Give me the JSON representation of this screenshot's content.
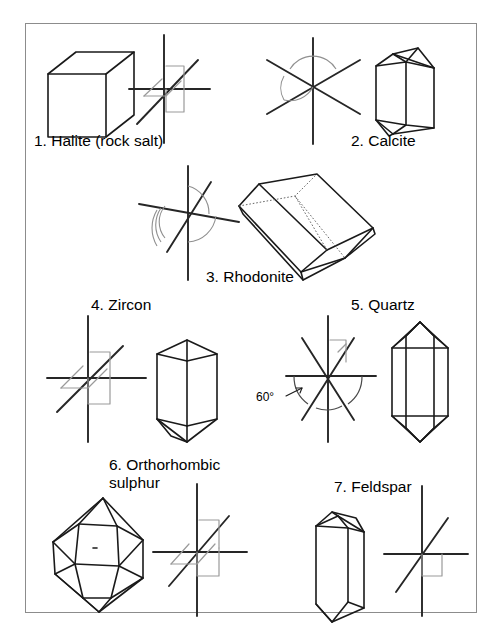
{
  "figure": {
    "title_visible": false,
    "border_color": "#8c8c8c",
    "background": "#ffffff",
    "ink_color": "#1a1a1a",
    "faint_color": "#9a9a9a"
  },
  "items": [
    {
      "id": 1,
      "number": "1.",
      "name": "Halite (rock salt)",
      "caption": "1. Halite (rock salt)",
      "crystal_shape": "cube",
      "axis_system": "cubic",
      "axes_count": 3,
      "angle_label": null
    },
    {
      "id": 2,
      "number": "2.",
      "name": "Calcite",
      "caption": "2. Calcite",
      "crystal_shape": "hexagonal-prism",
      "axis_system": "hexagonal-rhombohedral",
      "axes_count": 4,
      "angle_label": null
    },
    {
      "id": 3,
      "number": "3.",
      "name": "Rhodonite",
      "caption": "3. Rhodonite",
      "crystal_shape": "oblique-box",
      "axis_system": "triclinic",
      "axes_count": 3,
      "angle_label": null
    },
    {
      "id": 4,
      "number": "4.",
      "name": "Zircon",
      "caption": "4. Zircon",
      "crystal_shape": "tetragonal-prism-pyramid",
      "axis_system": "tetragonal",
      "axes_count": 3,
      "angle_label": null
    },
    {
      "id": 5,
      "number": "5.",
      "name": "Quartz",
      "caption": "5. Quartz",
      "crystal_shape": "hexagonal-bipyramid",
      "axis_system": "hexagonal",
      "axes_count": 4,
      "angle_label": "60°"
    },
    {
      "id": 6,
      "number": "6.",
      "name": "Orthorhombic sulphur",
      "caption": "6. Orthorhombic\nsulphur",
      "crystal_shape": "bipyramid",
      "axis_system": "orthorhombic",
      "axes_count": 3,
      "angle_label": null
    },
    {
      "id": 7,
      "number": "7.",
      "name": "Feldspar",
      "caption": "7. Feldspar",
      "crystal_shape": "monoclinic-prism",
      "axis_system": "monoclinic",
      "axes_count": 3,
      "angle_label": null
    }
  ]
}
